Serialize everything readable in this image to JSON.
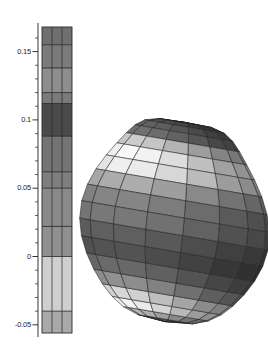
{
  "figure": {
    "title": "",
    "background_color": "#ffffff",
    "stroke_color": "#1d1d1d"
  },
  "colorbar": {
    "name": "colorbar",
    "orientation": "vertical",
    "x": 42,
    "y": 27,
    "width": 30,
    "height": 306,
    "subcolumns": 3,
    "axis": {
      "x": 38,
      "value_min": -0.056,
      "value_max": 0.168,
      "major_ticks": [
        {
          "value": 0.15,
          "label": "0.15"
        },
        {
          "value": 0.1,
          "label": "0.1"
        },
        {
          "value": 0.05,
          "label": "0.05"
        },
        {
          "value": 0.0,
          "label": "0"
        },
        {
          "value": -0.05,
          "label": "-0.05"
        }
      ],
      "minor_tick_step": 0.01
    },
    "bands": [
      {
        "from": 0.155,
        "to": 0.168,
        "color": "#6f6f6f"
      },
      {
        "from": 0.138,
        "to": 0.155,
        "color": "#7b7b7b"
      },
      {
        "from": 0.12,
        "to": 0.138,
        "color": "#8e8e8e"
      },
      {
        "from": 0.112,
        "to": 0.12,
        "color": "#7a7a7a"
      },
      {
        "from": 0.088,
        "to": 0.112,
        "color": "#4a4a4a"
      },
      {
        "from": 0.062,
        "to": 0.088,
        "color": "#747474"
      },
      {
        "from": 0.05,
        "to": 0.062,
        "color": "#7e7e7e"
      },
      {
        "from": 0.022,
        "to": 0.05,
        "color": "#8a8a8a"
      },
      {
        "from": 0.0,
        "to": 0.022,
        "color": "#909090"
      },
      {
        "from": -0.04,
        "to": 0.0,
        "color": "#cfcfcf"
      },
      {
        "from": -0.056,
        "to": -0.04,
        "color": "#a9a9a9"
      }
    ]
  },
  "surface_plot": {
    "name": "surface-plot",
    "type": "3d-parametric-surface",
    "center_x": 175,
    "center_y": 222,
    "half_width": 83,
    "half_height": 108,
    "longitude_divisions": 16,
    "latitude_divisions": 18,
    "mesh_color": "#1f1f1f",
    "description": "shaded latitude-longitude mesh blob",
    "latitude_band_colors": [
      "#585858",
      "#4e4e4e",
      "#5e5e5e",
      "#6a6a6a",
      "#bdbdbd",
      "#e2e2e2",
      "#d6d6d6",
      "#9a9a9a",
      "#777777",
      "#6b6b6b",
      "#555555",
      "#4a4a4a",
      "#5f5f5f",
      "#848484",
      "#c8c8c8",
      "#e8e8e8",
      "#b4b4b4",
      "#6e6e6e"
    ],
    "shading_left_factor": 0.78,
    "shading_right_factor": 0.62
  }
}
